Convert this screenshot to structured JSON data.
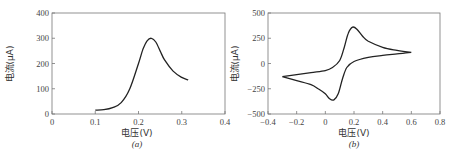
{
  "chart_data": [
    {
      "type": "line",
      "panel_label": "(a)",
      "xlabel": "电压(V)",
      "ylabel": "电流(μA)",
      "xlim": [
        0,
        0.4
      ],
      "ylim": [
        0,
        400
      ],
      "xticks": [
        "0",
        "0.1",
        "0.2",
        "0.3",
        "0.4"
      ],
      "yticks": [
        "0",
        "100",
        "200",
        "300",
        "400"
      ],
      "grid": false,
      "series": [
        {
          "name": "peak",
          "x": [
            0.1,
            0.12,
            0.14,
            0.16,
            0.18,
            0.2,
            0.21,
            0.22,
            0.23,
            0.24,
            0.25,
            0.26,
            0.28,
            0.3,
            0.315
          ],
          "y": [
            15,
            17,
            25,
            45,
            100,
            200,
            255,
            290,
            300,
            285,
            250,
            215,
            170,
            145,
            135
          ]
        }
      ]
    },
    {
      "type": "line",
      "panel_label": "(b)",
      "xlabel": "电压(V)",
      "ylabel": "电流(μA)",
      "xlim": [
        -0.4,
        0.8
      ],
      "ylim": [
        -500,
        500
      ],
      "xticks": [
        "-0.4",
        "-0.2",
        "0",
        "0.2",
        "0.4",
        "0.6",
        "0.8"
      ],
      "yticks": [
        "-500",
        "-250",
        "0",
        "250",
        "500"
      ],
      "grid": false,
      "series": [
        {
          "name": "forward scan",
          "x": [
            -0.3,
            -0.2,
            -0.1,
            0.0,
            0.05,
            0.1,
            0.13,
            0.16,
            0.19,
            0.22,
            0.26,
            0.3,
            0.4,
            0.5,
            0.6
          ],
          "y": [
            -130,
            -110,
            -90,
            -70,
            -40,
            30,
            150,
            300,
            360,
            340,
            270,
            220,
            160,
            130,
            110
          ]
        },
        {
          "name": "reverse scan",
          "x": [
            0.6,
            0.5,
            0.4,
            0.3,
            0.2,
            0.15,
            0.12,
            0.09,
            0.06,
            0.03,
            0.0,
            -0.05,
            -0.1,
            -0.2,
            -0.3
          ],
          "y": [
            110,
            95,
            80,
            60,
            20,
            -40,
            -150,
            -300,
            -360,
            -350,
            -300,
            -250,
            -210,
            -170,
            -130
          ]
        }
      ]
    }
  ]
}
